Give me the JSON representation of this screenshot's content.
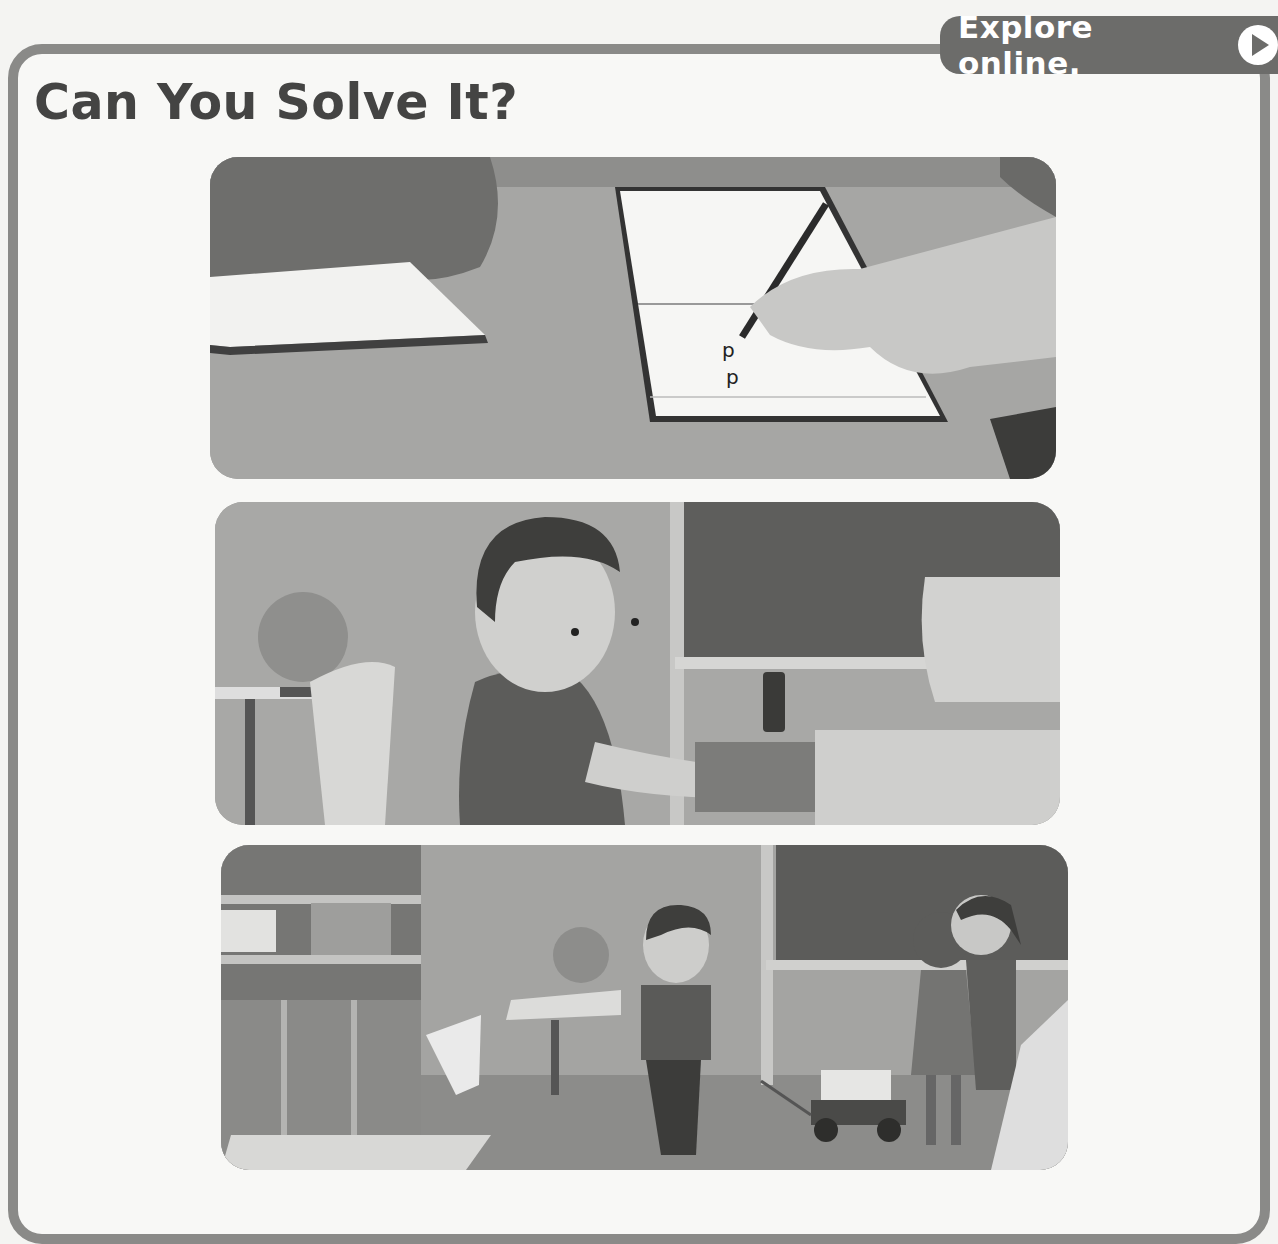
{
  "header": {
    "explore_label": "Explore online.",
    "explore_icon": "play-icon"
  },
  "section": {
    "title": "Can You Solve It?"
  },
  "panels": [
    {
      "label": "Hands writing the letter p in a notebook",
      "written_text": "p p"
    },
    {
      "label": "Boy opening a pencil box at a desk"
    },
    {
      "label": "Children pulling a wagon of boxes in a classroom",
      "icon": "recycle-icon"
    }
  ],
  "colors": {
    "frame": "#8a8a88",
    "explore_bg": "#6c6c6a",
    "title": "#444443"
  }
}
